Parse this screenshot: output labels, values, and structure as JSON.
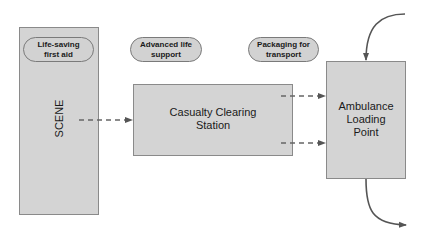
{
  "diagram": {
    "nodes": {
      "scene": {
        "label": "SCENE"
      },
      "casualty_clearing_station": {
        "label": "Casualty Clearing\nStation"
      },
      "ambulance_loading_point": {
        "label": "Ambulance\nLoading\nPoint"
      }
    },
    "phases": [
      {
        "label": "Life-saving\nfirst aid"
      },
      {
        "label": "Advanced life\nsupport"
      },
      {
        "label": "Packaging for\ntransport"
      }
    ],
    "edges": [
      {
        "from": "scene",
        "to": "casualty_clearing_station",
        "style": "dashed"
      },
      {
        "from": "casualty_clearing_station",
        "to": "ambulance_loading_point",
        "style": "dashed"
      },
      {
        "from": "casualty_clearing_station",
        "to": "ambulance_loading_point",
        "style": "dashed"
      },
      {
        "from": "incoming",
        "to": "ambulance_loading_point",
        "style": "solid-curved"
      },
      {
        "from": "ambulance_loading_point",
        "to": "outgoing",
        "style": "solid-curved"
      }
    ],
    "colors": {
      "box_fill": "#d4d4d4",
      "box_border": "#8a8a8a",
      "arrow": "#555555"
    }
  }
}
